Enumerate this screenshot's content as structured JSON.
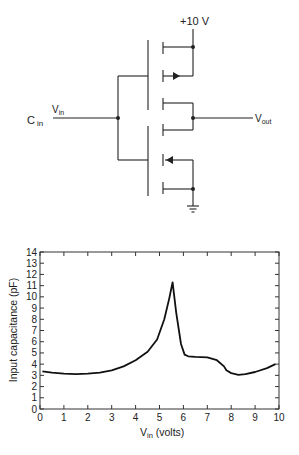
{
  "circuit": {
    "supply_label": "+10 V",
    "input_label_main": "V",
    "input_label_sub": "in",
    "cap_label_main": "C",
    "cap_label_sub": "in",
    "output_label_main": "V",
    "output_label_sub": "out"
  },
  "chart_data": {
    "type": "line",
    "title": "",
    "xlabel": "V_in (volts)",
    "xlabel_main": "V",
    "xlabel_sub": "in",
    "xlabel_rest": " (volts)",
    "ylabel": "Input capacitance (pF)",
    "xlim": [
      0,
      10
    ],
    "ylim": [
      0,
      14
    ],
    "xticks": [
      "0",
      "1",
      "2",
      "3",
      "4",
      "5",
      "6",
      "7",
      "8",
      "9",
      "10"
    ],
    "yticks": [
      "0",
      "1",
      "2",
      "3",
      "4",
      "5",
      "6",
      "7",
      "8",
      "9",
      "10",
      "11",
      "12",
      "13",
      "14"
    ],
    "grid": false,
    "series": [
      {
        "name": "Input capacitance",
        "x": [
          0.1,
          0.5,
          1.0,
          1.5,
          2.0,
          2.5,
          3.0,
          3.5,
          4.0,
          4.5,
          4.9,
          5.2,
          5.4,
          5.55,
          5.7,
          5.9,
          6.05,
          6.2,
          6.5,
          7.0,
          7.4,
          7.7,
          7.8,
          8.0,
          8.3,
          8.6,
          9.0,
          9.5,
          9.85
        ],
        "y": [
          3.35,
          3.25,
          3.15,
          3.1,
          3.15,
          3.25,
          3.45,
          3.8,
          4.35,
          5.1,
          6.2,
          8.0,
          9.8,
          11.3,
          8.6,
          5.8,
          4.85,
          4.7,
          4.65,
          4.6,
          4.35,
          3.8,
          3.45,
          3.2,
          3.05,
          3.1,
          3.3,
          3.65,
          4.0
        ]
      }
    ]
  }
}
